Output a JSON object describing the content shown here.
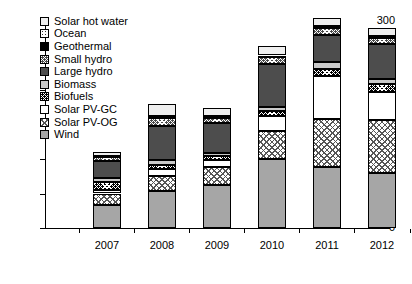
{
  "chart_data": {
    "type": "bar",
    "subtype": "stacked-bar",
    "title": "",
    "xlabel": "",
    "ylabel": "",
    "ylim": [
      0,
      300
    ],
    "yticks": [
      0,
      50,
      100,
      150,
      200,
      250,
      300
    ],
    "ytick_labels": [
      "0",
      "50",
      "100",
      "150",
      "200",
      "250",
      "300"
    ],
    "grid": false,
    "legend_position": "upper-left",
    "categories": [
      "2007",
      "2008",
      "2009",
      "2010",
      "2011",
      "2012"
    ],
    "series": [
      {
        "name": "Wind",
        "key": "wind",
        "swatch": "solid-gray",
        "color": "#a6a6a6",
        "values": [
          33,
          53,
          63,
          100,
          88,
          80
        ]
      },
      {
        "name": "Solar PV-OG",
        "key": "pvog",
        "swatch": "crosshatch-light",
        "color": "#ffffff",
        "values": [
          17,
          22,
          25,
          40,
          70,
          77
        ]
      },
      {
        "name": "Solar PV-GC",
        "key": "pvgc",
        "swatch": "white",
        "color": "#ffffff",
        "values": [
          5,
          10,
          10,
          22,
          63,
          40
        ]
      },
      {
        "name": "Biofuels",
        "key": "biofuels",
        "swatch": "checker-black",
        "color": "#000000",
        "values": [
          12,
          6,
          6,
          8,
          10,
          12
        ]
      },
      {
        "name": "Biomass",
        "key": "biomass",
        "swatch": "solid-lightgray",
        "color": "#c9c9c9",
        "values": [
          5,
          7,
          5,
          6,
          9,
          7
        ]
      },
      {
        "name": "Large hydro",
        "key": "lhydro",
        "swatch": "solid-darkgray",
        "color": "#4d4d4d",
        "values": [
          25,
          50,
          43,
          62,
          40,
          50
        ]
      },
      {
        "name": "Small hydro",
        "key": "shydro",
        "swatch": "checker-darkgray",
        "color": "#4a4a4a",
        "values": [
          6,
          12,
          8,
          10,
          11,
          10
        ]
      },
      {
        "name": "Geothermal",
        "key": "geo",
        "swatch": "solid-black",
        "color": "#000000",
        "values": [
          1,
          1,
          1,
          1,
          1,
          1
        ]
      },
      {
        "name": "Ocean",
        "key": "ocean",
        "swatch": "dotted",
        "color": "#ffffff",
        "values": [
          1,
          1,
          1,
          1,
          1,
          1
        ]
      },
      {
        "name": "Solar hot water",
        "key": "shw",
        "swatch": "solid-offwhite",
        "color": "#efefef",
        "values": [
          5,
          17,
          12,
          14,
          11,
          12
        ]
      }
    ],
    "totals": [
      110,
      179,
      174,
      264,
      304,
      290
    ]
  },
  "legend": {
    "items": [
      {
        "label": "Solar hot water"
      },
      {
        "label": "Ocean"
      },
      {
        "label": "Geothermal"
      },
      {
        "label": "Small hydro"
      },
      {
        "label": "Large hydro"
      },
      {
        "label": "Biomass"
      },
      {
        "label": "Biofuels"
      },
      {
        "label": "Solar PV-GC"
      },
      {
        "label": "Solar PV-OG"
      },
      {
        "label": "Wind"
      }
    ]
  }
}
